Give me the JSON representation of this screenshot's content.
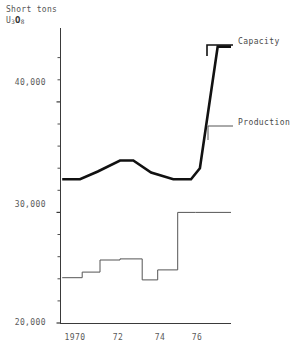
{
  "chart_data": {
    "type": "line",
    "title": "",
    "ylabel": "Short tons U3O8",
    "ylabel_parts": {
      "line1": "Short tons",
      "prefix": "U",
      "sub1": "3",
      "mid": "O",
      "sub2": "8"
    },
    "xlabel": "",
    "xlim": [
      1969.3,
      1977.0
    ],
    "ylim": [
      20000,
      46500
    ],
    "yticks": [
      20000,
      30000,
      40000
    ],
    "ytick_labels": [
      "20,000",
      "30,000",
      "40,000"
    ],
    "yminor_step": 2000,
    "xticks": [
      1970,
      1972,
      1974,
      1976
    ],
    "xtick_labels": [
      "1970",
      "72",
      "74",
      "76"
    ],
    "grid": false,
    "legend_position": "right-inline",
    "series": [
      {
        "name": "Capacity",
        "style": "thick-line",
        "color": "#111111",
        "x": [
          1969.4,
          1970.2,
          1971.0,
          1972.0,
          1972.6,
          1973.4,
          1974.4,
          1975.2,
          1975.6,
          1976.4,
          1977.0
        ],
        "values": [
          33000,
          33000,
          33700,
          34700,
          34700,
          33600,
          33000,
          33000,
          34000,
          45000,
          45000
        ]
      },
      {
        "name": "Production",
        "style": "thin-step",
        "color": "#555555",
        "x": [
          1969.4,
          1970.3,
          1970.3,
          1971.1,
          1971.1,
          1972.0,
          1972.0,
          1973.0,
          1973.0,
          1973.7,
          1973.7,
          1974.6,
          1974.6,
          1975.4,
          1975.4,
          1977.0
        ],
        "values": [
          24100,
          24100,
          24600,
          24600,
          25700,
          25700,
          25800,
          25800,
          23900,
          23900,
          24800,
          24800,
          30000,
          30000,
          30000,
          30000
        ]
      }
    ],
    "annotations": [
      {
        "label": "Capacity",
        "x_px": 238,
        "y_px": 41
      },
      {
        "label": "Production",
        "x_px": 238,
        "y_px": 122
      }
    ]
  },
  "colors": {
    "capacity": "#111111",
    "production": "#555555",
    "axis": "#3a3a3a",
    "text": "#555555",
    "background": "#ffffff"
  }
}
